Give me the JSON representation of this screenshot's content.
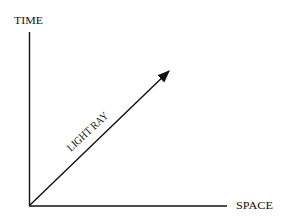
{
  "diagram": {
    "type": "spacetime-diagram",
    "y_axis_label": "TIME",
    "x_axis_label": "SPACE",
    "ray_label": "LIGHT RAY",
    "line_color": "#111111",
    "background": "#ffffff"
  }
}
